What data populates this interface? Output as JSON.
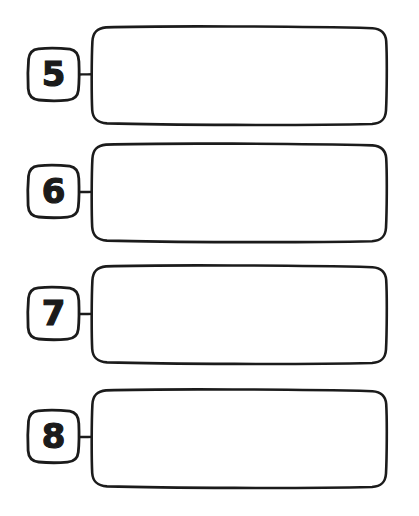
{
  "page": {
    "background_color": "#ffffff",
    "ink_color": "#1b1b1b",
    "style": "hand-drawn",
    "width": 419,
    "height": 516
  },
  "rows": [
    {
      "number": "5",
      "number_box_name": "number-box-5",
      "answer_box_name": "answer-box-5",
      "answer_text": ""
    },
    {
      "number": "6",
      "number_box_name": "number-box-6",
      "answer_box_name": "answer-box-6",
      "answer_text": ""
    },
    {
      "number": "7",
      "number_box_name": "number-box-7",
      "answer_box_name": "answer-box-7",
      "answer_text": ""
    },
    {
      "number": "8",
      "number_box_name": "number-box-8",
      "answer_box_name": "answer-box-8",
      "answer_text": ""
    }
  ]
}
